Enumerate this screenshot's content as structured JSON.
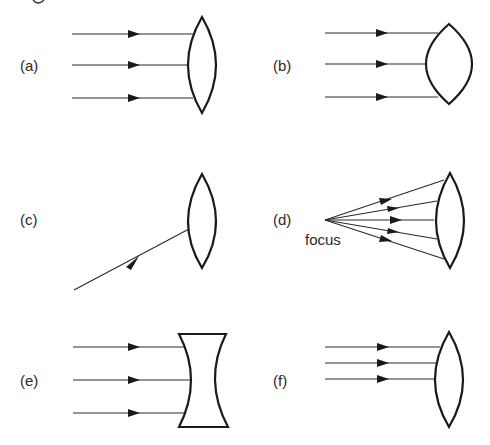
{
  "figure": {
    "panels": [
      {
        "id": "a",
        "label": "(a)",
        "lens": "biconvex-thin",
        "rays": "3 parallel, wide spacing"
      },
      {
        "id": "b",
        "label": "(b)",
        "lens": "biconvex-thick",
        "rays": "3 parallel, wide spacing"
      },
      {
        "id": "c",
        "label": "(c)",
        "lens": "biconvex-thin",
        "rays": "1 oblique ray"
      },
      {
        "id": "d",
        "label": "(d)",
        "lens": "biconvex-thin",
        "rays": "5 diverging from focus",
        "annotation": "focus"
      },
      {
        "id": "e",
        "label": "(e)",
        "lens": "biconcave",
        "rays": "3 parallel, wide spacing"
      },
      {
        "id": "f",
        "label": "(f)",
        "lens": "biconvex-thin",
        "rays": "3 parallel, narrow spacing"
      }
    ],
    "colors": {
      "ink": "#1a1a1a",
      "background": "#ffffff"
    }
  }
}
